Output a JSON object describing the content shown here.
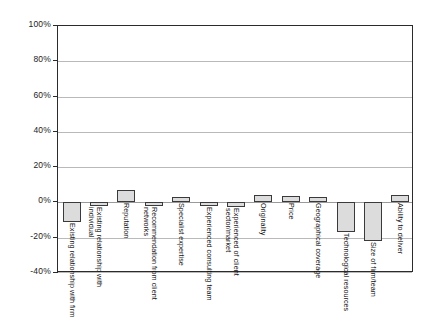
{
  "chart_data": {
    "type": "bar",
    "title": "",
    "subtitle": "",
    "xlabel": "",
    "ylabel": "",
    "ylim": [
      -40,
      100
    ],
    "ytick_values": [
      100,
      80,
      60,
      40,
      20,
      0,
      -20,
      -40
    ],
    "ytick_labels": [
      "100%",
      "80%",
      "60%",
      "40%",
      "20%",
      "0%",
      "-20%",
      "-40%"
    ],
    "grid": true,
    "legend": false,
    "legend_position": "none",
    "orientation": "vertical",
    "value_unit": "percent",
    "bar_fill_color": "#dcdcdc",
    "bar_border_color": "#3a3a3a",
    "gridline_color": "#b9b9b9",
    "axis_color": "#2b2b2b",
    "categories": [
      "Existing relationship with firm",
      "Existing relationship with individual",
      "Reputation",
      "Recommendation from client networks",
      "Specialist expertise",
      "Experienced consulting team",
      "Experienced of client sector/market",
      "Originality",
      "Price",
      "Geographical coverage",
      "Technological resources",
      "Size of firm/team",
      "Ability to deliver"
    ],
    "values": [
      -11,
      -2,
      7,
      -2,
      3,
      -2,
      -2.5,
      4,
      3.5,
      3,
      -17,
      -22,
      4
    ]
  }
}
